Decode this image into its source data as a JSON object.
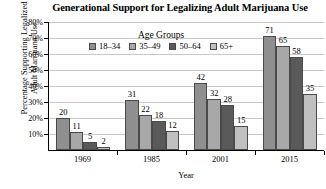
{
  "chart_data": {
    "type": "bar",
    "title": "Generational Support for Legalizing Adult Marijuana Use",
    "xlabel": "Year",
    "ylabel_line1": "Percentage Supporting Legalized",
    "ylabel_line2": "Adult Marijuana Use",
    "categories": [
      "1969",
      "1985",
      "2001",
      "2015"
    ],
    "ylim": [
      0,
      80
    ],
    "ytick_labels": [
      "10%",
      "20%",
      "30%",
      "40%",
      "50%",
      "60%",
      "70%",
      "80%"
    ],
    "ytick_values": [
      10,
      20,
      30,
      40,
      50,
      60,
      70,
      80
    ],
    "grid": true,
    "legend_title": "Age Groups",
    "legend_position": "upper-left-inside",
    "series": [
      {
        "name": "18–34",
        "color": "#8f8f8f",
        "values": [
          20,
          31,
          42,
          71
        ]
      },
      {
        "name": "35–49",
        "color": "#a8a8a8",
        "values": [
          11,
          22,
          32,
          65
        ]
      },
      {
        "name": "50–64",
        "color": "#5a5a5a",
        "values": [
          5,
          18,
          28,
          58
        ]
      },
      {
        "name": "65+",
        "color": "#c0c0c0",
        "values": [
          2,
          12,
          15,
          35
        ]
      }
    ],
    "value_labels": [
      [
        "20",
        "11",
        "5",
        "2"
      ],
      [
        "31",
        "22",
        "18",
        "12"
      ],
      [
        "42",
        "32",
        "28",
        "15"
      ],
      [
        "71",
        "65",
        "58",
        "35"
      ]
    ]
  },
  "colors": {
    "background": "#ffffff",
    "axis": "#000000",
    "gridline": "#c8c8c8",
    "bar_border": "#4a4a4a"
  }
}
